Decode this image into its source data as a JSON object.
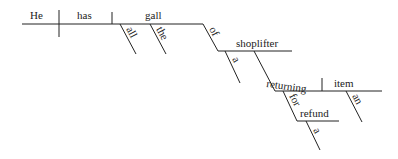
{
  "diagram": {
    "type": "Reed-Kellogg sentence diagram",
    "sentence_words": [
      "He",
      "has",
      "all",
      "the",
      "gall",
      "of",
      "a",
      "shoplifter",
      "returning",
      "an",
      "item",
      "for",
      "a",
      "refund"
    ],
    "baseline": {
      "subject": "He",
      "verb": "has",
      "object": "gall"
    },
    "modifiers": {
      "gall": [
        "all",
        "the"
      ],
      "prep_of": {
        "preposition": "of",
        "object": "shoplifter",
        "modifiers": [
          "a"
        ]
      },
      "participle": {
        "word": "returning",
        "object": "item",
        "object_modifiers": [
          "an"
        ]
      },
      "prep_for": {
        "preposition": "for",
        "object": "refund",
        "modifiers": [
          "a"
        ]
      }
    },
    "labels": {
      "he": "He",
      "has": "has",
      "gall": "gall",
      "all": "all",
      "the": "the",
      "of": "of",
      "shoplifter": "shoplifter",
      "a1": "a",
      "returning": "returning",
      "item": "item",
      "an": "an",
      "for": "for",
      "refund": "refund",
      "a2": "a"
    }
  }
}
